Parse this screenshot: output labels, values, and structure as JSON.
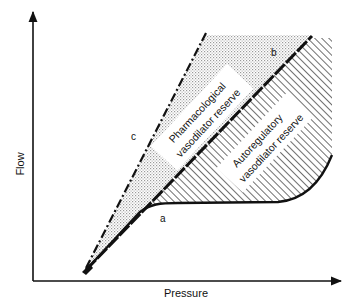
{
  "diagram": {
    "axes": {
      "x_label": "Pressure",
      "y_label": "Flow"
    },
    "curves": {
      "a": {
        "label": "a",
        "description": "autoregulated flow (solid curve with plateau)"
      },
      "b": {
        "label": "b",
        "description": "maximal autoregulatory vasodilation (thick dashed line)"
      },
      "c": {
        "label": "c",
        "description": "maximal pharmacological vasodilation (dash-dot line)"
      }
    },
    "regions": {
      "pharmacological": {
        "line1": "Pharmacological",
        "line2": "vasodilator reserve",
        "fill": "stippled"
      },
      "autoregulatory": {
        "line1": "Autoregulatory",
        "line2": "vasodilator reserve",
        "fill": "hatched"
      }
    },
    "colors": {
      "ink": "#111111",
      "background": "#ffffff",
      "stipple": "#bdbdbd"
    }
  }
}
